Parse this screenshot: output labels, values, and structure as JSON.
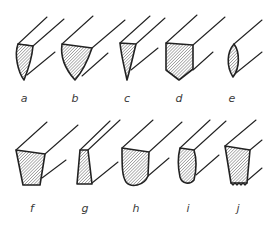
{
  "figure": {
    "title": "",
    "colors": {
      "line": "#222222",
      "hatch": "#6a6a6a",
      "background": "#ffffff"
    },
    "items": [
      {
        "id": "a",
        "label": "a",
        "shape": "curved-left-straight-right-point"
      },
      {
        "id": "b",
        "label": "b",
        "shape": "inverted-curved-triangle"
      },
      {
        "id": "c",
        "label": "c",
        "shape": "narrow-triangle"
      },
      {
        "id": "d",
        "label": "d",
        "shape": "pentagon-pointed-bottom"
      },
      {
        "id": "e",
        "label": "e",
        "shape": "lens-ellipse"
      },
      {
        "id": "f",
        "label": "f",
        "shape": "trapezoid-wide-top"
      },
      {
        "id": "g",
        "label": "g",
        "shape": "narrow-trapezoid"
      },
      {
        "id": "h",
        "label": "h",
        "shape": "flat-top-rounded-bottom"
      },
      {
        "id": "i",
        "label": "i",
        "shape": "rounded-narrow"
      },
      {
        "id": "j",
        "label": "j",
        "shape": "trapezoid-serrated-bottom"
      }
    ]
  }
}
